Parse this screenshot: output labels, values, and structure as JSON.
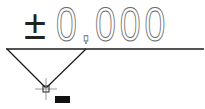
{
  "drawing": {
    "elevation_symbol": {
      "sign": "±",
      "value": "0.000",
      "line_color": "#222222",
      "text_outline_color": "#6a6a6a"
    },
    "cursor": {
      "type": "crosshair-pickbox",
      "x": 46,
      "y": 89
    },
    "dynamic_input_tooltip": {
      "text": ""
    }
  }
}
